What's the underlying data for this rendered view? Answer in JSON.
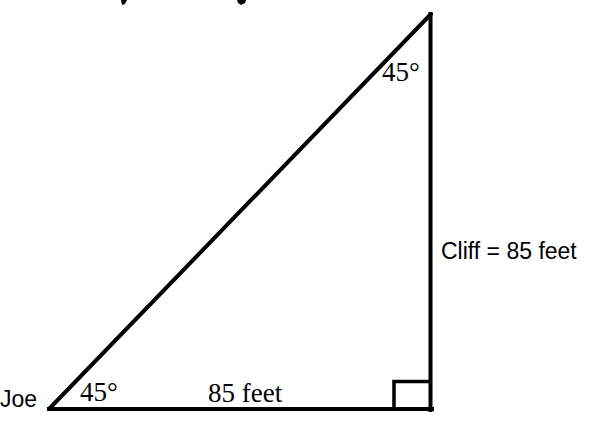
{
  "diagram": {
    "type": "right-triangle",
    "stroke_color": "#000000",
    "background": "#ffffff",
    "vertices": {
      "left": {
        "x": 49,
        "y": 409
      },
      "right_angle": {
        "x": 430,
        "y": 409
      },
      "apex": {
        "x": 430,
        "y": 14
      }
    },
    "right_angle_marker": {
      "x": 394,
      "y": 381,
      "size": 36
    },
    "labels": {
      "observer": "Joe",
      "bottom_angle": "45°",
      "top_angle": "45°",
      "base": "85 feet",
      "height": "Cliff = 85 feet"
    },
    "title_fragment_note": "cut-off title text above frame (only descenders visible)"
  }
}
